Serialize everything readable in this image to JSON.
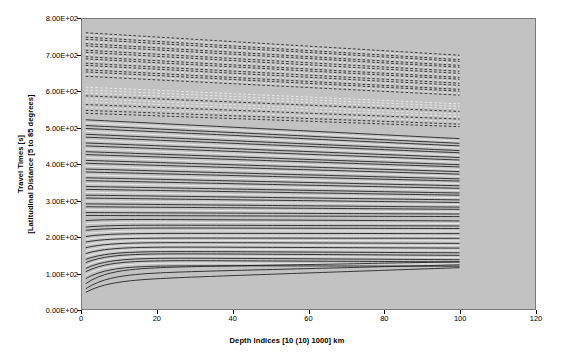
{
  "chart_data": {
    "type": "line",
    "title": "",
    "xlabel": "Depth Indices [10 (10) 1000] km",
    "ylabel_line1": "Travel Times [s]",
    "ylabel_line2": "[Latitudinal Distance [5 to 85 degrees]",
    "xlim": [
      0,
      120
    ],
    "ylim": [
      0,
      800
    ],
    "xticks": [
      0,
      20,
      40,
      60,
      80,
      100,
      120
    ],
    "xticklabels": [
      "0",
      "20",
      "40",
      "60",
      "80",
      "100",
      "120"
    ],
    "yticks": [
      0,
      100,
      200,
      300,
      400,
      500,
      600,
      700,
      800
    ],
    "yticklabels": [
      "0.00E+00",
      "1.00E+02",
      "2.00E+02",
      "3.00E+02",
      "4.00E+02",
      "5.00E+02",
      "6.00E+02",
      "7.00E+02",
      "8.00E+02"
    ],
    "grid": false,
    "legend": "none",
    "plot_bgcolor": "#c2c2c2",
    "line_color": "#1a1a1a",
    "line_color_light": "#efefef",
    "data_x_start": 1,
    "data_x_end": 100,
    "series": [
      {
        "name": "dashed-upper-01",
        "style": "dashed",
        "shade": "dark",
        "y_start": 762,
        "y_end": 700
      },
      {
        "name": "dashed-upper-02",
        "style": "dashed",
        "shade": "light",
        "y_start": 756,
        "y_end": 694
      },
      {
        "name": "dashed-upper-03",
        "style": "dashed",
        "shade": "dark",
        "y_start": 750,
        "y_end": 688
      },
      {
        "name": "dashed-upper-04",
        "style": "dashed",
        "shade": "dark",
        "y_start": 744,
        "y_end": 683
      },
      {
        "name": "dashed-upper-05",
        "style": "dashed",
        "shade": "light",
        "y_start": 738,
        "y_end": 678
      },
      {
        "name": "dashed-upper-06",
        "style": "dashed",
        "shade": "dark",
        "y_start": 732,
        "y_end": 672
      },
      {
        "name": "dashed-upper-07",
        "style": "dashed",
        "shade": "dark",
        "y_start": 726,
        "y_end": 667
      },
      {
        "name": "dashed-upper-08",
        "style": "dashed",
        "shade": "light",
        "y_start": 720,
        "y_end": 661
      },
      {
        "name": "dashed-upper-09",
        "style": "dashed",
        "shade": "dark",
        "y_start": 714,
        "y_end": 656
      },
      {
        "name": "dashed-upper-10",
        "style": "dashed",
        "shade": "dark",
        "y_start": 708,
        "y_end": 650
      },
      {
        "name": "dashed-upper-11",
        "style": "dashed",
        "shade": "light",
        "y_start": 702,
        "y_end": 645
      },
      {
        "name": "dashed-upper-12",
        "style": "dashed",
        "shade": "dark",
        "y_start": 696,
        "y_end": 639
      },
      {
        "name": "dashed-upper-13",
        "style": "dashed",
        "shade": "dark",
        "y_start": 690,
        "y_end": 634
      },
      {
        "name": "dashed-upper-14",
        "style": "dashed",
        "shade": "light",
        "y_start": 684,
        "y_end": 628
      },
      {
        "name": "dashed-upper-15",
        "style": "dashed",
        "shade": "dark",
        "y_start": 678,
        "y_end": 623
      },
      {
        "name": "dashed-upper-16",
        "style": "dashed",
        "shade": "dark",
        "y_start": 672,
        "y_end": 617
      },
      {
        "name": "dashed-upper-17",
        "style": "dashed",
        "shade": "light",
        "y_start": 666,
        "y_end": 612
      },
      {
        "name": "dashed-upper-18",
        "style": "dashed",
        "shade": "dark",
        "y_start": 660,
        "y_end": 606
      },
      {
        "name": "dashed-upper-19",
        "style": "dashed",
        "shade": "dark",
        "y_start": 654,
        "y_end": 601
      },
      {
        "name": "dashed-upper-20",
        "style": "dashed",
        "shade": "light",
        "y_start": 648,
        "y_end": 595
      },
      {
        "name": "dashed-upper-21",
        "style": "dashed",
        "shade": "dark",
        "y_start": 642,
        "y_end": 590
      },
      {
        "name": "dashed-mid-01",
        "style": "dashed",
        "shade": "light",
        "y_start": 612,
        "y_end": 566
      },
      {
        "name": "dashed-mid-02",
        "style": "dashed",
        "shade": "light",
        "y_start": 604,
        "y_end": 559
      },
      {
        "name": "dashed-mid-03",
        "style": "dashed",
        "shade": "light",
        "y_start": 596,
        "y_end": 552
      },
      {
        "name": "dashed-mid-04",
        "style": "dashed",
        "shade": "dark",
        "y_start": 588,
        "y_end": 545
      },
      {
        "name": "dashed-mid-05",
        "style": "dashed",
        "shade": "light",
        "y_start": 580,
        "y_end": 538
      },
      {
        "name": "dashed-mid-06",
        "style": "dashed",
        "shade": "light",
        "y_start": 572,
        "y_end": 531
      },
      {
        "name": "dashed-mid-07",
        "style": "dashed",
        "shade": "dark",
        "y_start": 564,
        "y_end": 524
      },
      {
        "name": "dashed-mid-08",
        "style": "dashed",
        "shade": "light",
        "y_start": 556,
        "y_end": 517
      },
      {
        "name": "dashed-mid-09",
        "style": "dashed",
        "shade": "dark",
        "y_start": 548,
        "y_end": 510
      },
      {
        "name": "dashed-mid-10",
        "style": "dashed",
        "shade": "dark",
        "y_start": 540,
        "y_end": 503
      },
      {
        "name": "solid-a-01",
        "style": "solid",
        "shade": "dark",
        "y_start": 522,
        "y_end": 470
      },
      {
        "name": "solid-a-02",
        "style": "solid",
        "shade": "light",
        "y_start": 514,
        "y_end": 463
      },
      {
        "name": "solid-a-03",
        "style": "solid",
        "shade": "dark",
        "y_start": 506,
        "y_end": 457
      },
      {
        "name": "solid-a-04",
        "style": "solid",
        "shade": "dark",
        "y_start": 498,
        "y_end": 450
      },
      {
        "name": "solid-a-05",
        "style": "solid",
        "shade": "light",
        "y_start": 490,
        "y_end": 444
      },
      {
        "name": "solid-a-06",
        "style": "solid",
        "shade": "dark",
        "y_start": 482,
        "y_end": 437
      },
      {
        "name": "solid-a-07",
        "style": "solid",
        "shade": "dark",
        "y_start": 474,
        "y_end": 431
      },
      {
        "name": "solid-a-08",
        "style": "solid",
        "shade": "light",
        "y_start": 466,
        "y_end": 424
      },
      {
        "name": "solid-a-09",
        "style": "solid",
        "shade": "dark",
        "y_start": 458,
        "y_end": 418
      },
      {
        "name": "solid-a-10",
        "style": "solid",
        "shade": "dark",
        "y_start": 450,
        "y_end": 411
      },
      {
        "name": "solid-a-11",
        "style": "solid",
        "shade": "light",
        "y_start": 442,
        "y_end": 405
      },
      {
        "name": "solid-a-12",
        "style": "solid",
        "shade": "dark",
        "y_start": 434,
        "y_end": 398
      },
      {
        "name": "solid-a-13",
        "style": "solid",
        "shade": "dark",
        "y_start": 426,
        "y_end": 392
      },
      {
        "name": "solid-a-14",
        "style": "solid",
        "shade": "light",
        "y_start": 418,
        "y_end": 385
      },
      {
        "name": "solid-a-15",
        "style": "solid",
        "shade": "dark",
        "y_start": 410,
        "y_end": 379
      },
      {
        "name": "solid-a-16",
        "style": "solid",
        "shade": "dark",
        "y_start": 402,
        "y_end": 372
      },
      {
        "name": "solid-a-17",
        "style": "solid",
        "shade": "light",
        "y_start": 394,
        "y_end": 366
      },
      {
        "name": "solid-a-18",
        "style": "solid",
        "shade": "dark",
        "y_start": 386,
        "y_end": 359
      },
      {
        "name": "solid-a-19",
        "style": "solid",
        "shade": "dark",
        "y_start": 378,
        "y_end": 353
      },
      {
        "name": "solid-a-20",
        "style": "solid",
        "shade": "light",
        "y_start": 370,
        "y_end": 346
      },
      {
        "name": "solid-a-21",
        "style": "solid",
        "shade": "dark",
        "y_start": 362,
        "y_end": 340
      },
      {
        "name": "solid-a-22",
        "style": "solid",
        "shade": "dark",
        "y_start": 354,
        "y_end": 333
      },
      {
        "name": "solid-a-23",
        "style": "solid",
        "shade": "light",
        "y_start": 346,
        "y_end": 327
      },
      {
        "name": "solid-a-24",
        "style": "solid",
        "shade": "dark",
        "y_start": 338,
        "y_end": 320
      },
      {
        "name": "solid-a-25",
        "style": "solid",
        "shade": "dark",
        "y_start": 330,
        "y_end": 314
      },
      {
        "name": "solid-a-26",
        "style": "solid",
        "shade": "light",
        "y_start": 322,
        "y_end": 307
      },
      {
        "name": "solid-a-27",
        "style": "solid",
        "shade": "dark",
        "y_start": 314,
        "y_end": 301
      },
      {
        "name": "solid-a-28",
        "style": "solid",
        "shade": "dark",
        "y_start": 306,
        "y_end": 294
      },
      {
        "name": "solid-a-29",
        "style": "solid",
        "shade": "light",
        "y_start": 298,
        "y_end": 288
      },
      {
        "name": "solid-a-30",
        "style": "solid",
        "shade": "dark",
        "y_start": 290,
        "y_end": 281
      },
      {
        "name": "solid-a-31",
        "style": "solid",
        "shade": "dark",
        "y_start": 282,
        "y_end": 275
      },
      {
        "name": "solid-a-32",
        "style": "solid",
        "shade": "light",
        "y_start": 274,
        "y_end": 268
      },
      {
        "name": "solid-a-33",
        "style": "solid",
        "shade": "dark",
        "y_start": 266,
        "y_end": 262
      },
      {
        "name": "solid-a-34",
        "style": "solid",
        "shade": "dark",
        "y_start": 258,
        "y_end": 255
      },
      {
        "name": "solid-b-01",
        "style": "solid",
        "shade": "dark",
        "y_start": 248,
        "y_end": 243,
        "dip": 4
      },
      {
        "name": "solid-b-02",
        "style": "solid",
        "shade": "light",
        "y_start": 240,
        "y_end": 236,
        "dip": 5
      },
      {
        "name": "solid-b-03",
        "style": "solid",
        "shade": "dark",
        "y_start": 232,
        "y_end": 229,
        "dip": 6
      },
      {
        "name": "solid-b-04",
        "style": "solid",
        "shade": "dark",
        "y_start": 224,
        "y_end": 222,
        "dip": 7
      },
      {
        "name": "solid-b-05",
        "style": "solid",
        "shade": "light",
        "y_start": 216,
        "y_end": 215,
        "dip": 8
      },
      {
        "name": "solid-b-06",
        "style": "solid",
        "shade": "dark",
        "y_start": 209,
        "y_end": 208,
        "dip": 9
      },
      {
        "name": "solid-b-07",
        "style": "solid",
        "shade": "light",
        "y_start": 202,
        "y_end": 201,
        "dip": 10
      },
      {
        "name": "solid-b-08",
        "style": "solid",
        "shade": "dark",
        "y_start": 196,
        "y_end": 195,
        "dip": 11
      },
      {
        "name": "solid-b-09",
        "style": "solid",
        "shade": "light",
        "y_start": 190,
        "y_end": 188,
        "dip": 13
      },
      {
        "name": "solid-b-10",
        "style": "solid",
        "shade": "dark",
        "y_start": 184,
        "y_end": 181,
        "dip": 15
      },
      {
        "name": "solid-b-11",
        "style": "solid",
        "shade": "light",
        "y_start": 178,
        "y_end": 175,
        "dip": 17
      },
      {
        "name": "solid-b-12",
        "style": "solid",
        "shade": "dark",
        "y_start": 172,
        "y_end": 168,
        "dip": 19
      },
      {
        "name": "solid-b-13",
        "style": "solid",
        "shade": "light",
        "y_start": 166,
        "y_end": 162,
        "dip": 21
      },
      {
        "name": "solid-b-14",
        "style": "solid",
        "shade": "dark",
        "y_start": 160,
        "y_end": 155,
        "dip": 23
      },
      {
        "name": "solid-b-15",
        "style": "solid",
        "shade": "dark",
        "y_start": 154,
        "y_end": 148,
        "dip": 26
      },
      {
        "name": "solid-b-16",
        "style": "solid",
        "shade": "light",
        "y_start": 148,
        "y_end": 142,
        "dip": 28
      },
      {
        "name": "solid-b-17",
        "style": "solid",
        "shade": "dark",
        "y_start": 142,
        "y_end": 136,
        "dip": 30
      },
      {
        "name": "solid-b-18",
        "style": "solid",
        "shade": "dark",
        "y_start": 135,
        "y_end": 130,
        "dip": 32
      },
      {
        "name": "solid-b-19",
        "style": "solid",
        "shade": "light",
        "y_start": 128,
        "y_end": 124,
        "dip": 34
      },
      {
        "name": "solid-b-20",
        "style": "solid",
        "shade": "dark",
        "y_start": 120,
        "y_end": 118,
        "dip": 36
      },
      {
        "name": "solid-c-01",
        "style": "solid",
        "shade": "dark",
        "y_start": 112,
        "y_end": 130,
        "dip": 42
      },
      {
        "name": "solid-c-02",
        "style": "solid",
        "shade": "dark",
        "y_start": 96,
        "y_end": 122,
        "dip": 40
      },
      {
        "name": "solid-c-03",
        "style": "solid",
        "shade": "dark",
        "y_start": 78,
        "y_end": 114,
        "dip": 32
      }
    ]
  }
}
